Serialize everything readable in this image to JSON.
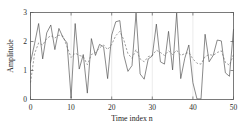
{
  "chart_data": {
    "type": "line",
    "title": "",
    "xlabel": "Time index n",
    "ylabel": "Amplitude",
    "xlim": [
      0,
      50
    ],
    "ylim": [
      0,
      3
    ],
    "xticks": [
      0,
      10,
      20,
      30,
      40,
      50
    ],
    "xticklabels": [
      "0",
      "10",
      "20",
      "30",
      "40",
      "50"
    ],
    "yticks": [
      0,
      1,
      2,
      3
    ],
    "yticklabels": [
      "0",
      "1",
      "2",
      "3"
    ],
    "grid": "vertical-faint",
    "legend": "none",
    "x": [
      0,
      1,
      2,
      3,
      4,
      5,
      6,
      7,
      8,
      9,
      10,
      11,
      12,
      13,
      14,
      15,
      16,
      17,
      18,
      19,
      20,
      21,
      22,
      23,
      24,
      25,
      26,
      27,
      28,
      29,
      30,
      31,
      32,
      33,
      34,
      35,
      36,
      37,
      38,
      39,
      40,
      41,
      42,
      43,
      44,
      45,
      46,
      47,
      48,
      49,
      50
    ],
    "series": [
      {
        "name": "noisy-signal",
        "style": "solid",
        "color": "#4a4a4a",
        "values": [
          1.27,
          1.92,
          2.62,
          1.4,
          2.3,
          2.57,
          1.72,
          2.45,
          2.14,
          1.95,
          0.05,
          2.62,
          1.05,
          1.55,
          0.22,
          2.1,
          1.52,
          1.9,
          1.82,
          0.72,
          2.22,
          2.68,
          2.72,
          1.52,
          0.97,
          1.17,
          2.98,
          0.88,
          0.7,
          1.4,
          1.5,
          2.6,
          1.3,
          1.22,
          2.35,
          1.02,
          2.98,
          0.72,
          1.42,
          1.88,
          0.58,
          0.02,
          0.02,
          2.25,
          1.3,
          1.52,
          2.05,
          2.02,
          0.92,
          0.8,
          2.42
        ]
      },
      {
        "name": "smoothed-signal",
        "style": "dashed",
        "color": "#6e6e6e",
        "values": [
          0.58,
          1.58,
          1.95,
          1.88,
          2.1,
          2.2,
          2.12,
          2.22,
          2.18,
          1.82,
          1.45,
          1.6,
          1.52,
          1.48,
          1.2,
          1.55,
          1.62,
          1.78,
          1.88,
          1.72,
          1.9,
          2.2,
          2.35,
          2.05,
          1.58,
          1.42,
          1.72,
          1.4,
          1.3,
          1.48,
          1.52,
          1.7,
          1.62,
          1.52,
          1.68,
          1.55,
          1.7,
          1.52,
          1.58,
          1.62,
          1.4,
          1.25,
          1.22,
          1.48,
          1.55,
          1.52,
          1.62,
          1.68,
          1.28,
          1.18,
          1.55
        ]
      }
    ]
  }
}
